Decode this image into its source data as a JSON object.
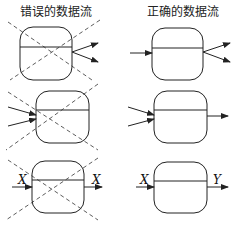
{
  "titles": {
    "wrong": "错误的数据流",
    "correct": "正确的数据流"
  },
  "labels": {
    "wrong_in": "X",
    "wrong_out": "X",
    "correct_in": "X",
    "correct_out": "Y"
  },
  "colors": {
    "stroke": "#222222",
    "background": "#ffffff"
  }
}
